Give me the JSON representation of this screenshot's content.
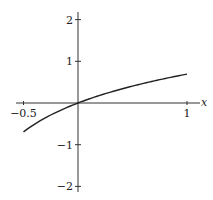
{
  "chart_data": {
    "type": "line",
    "title": "",
    "xlabel": "x",
    "ylabel": "",
    "xlim": [
      -0.5,
      1
    ],
    "ylim": [
      -2,
      2
    ],
    "grid": false,
    "x_ticks": [
      -0.5,
      1
    ],
    "x_tick_labels": [
      "−0.5",
      "1"
    ],
    "y_ticks": [
      2,
      1,
      -1,
      -2
    ],
    "y_tick_labels": [
      "2",
      "1",
      "−1",
      "−2"
    ],
    "series": [
      {
        "name": "ln(1+x)",
        "x": [
          -0.5,
          -0.25,
          0,
          0.25,
          0.5,
          0.75,
          1
        ],
        "y": [
          -0.693,
          -0.288,
          0,
          0.223,
          0.405,
          0.56,
          0.693
        ]
      }
    ]
  }
}
